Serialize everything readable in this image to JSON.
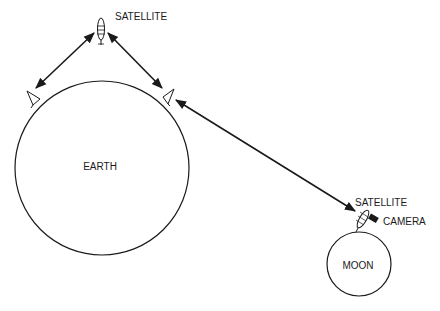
{
  "labels": {
    "top_satellite": "SATELLITE",
    "earth": "EARTH",
    "moon_satellite": "SATELLITE",
    "camera": "CAMERA",
    "moon": "MOON"
  },
  "colors": {
    "stroke": "#1a1a1a",
    "background": "#ffffff"
  }
}
